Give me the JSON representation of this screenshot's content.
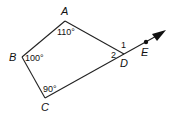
{
  "diagram": {
    "type": "quadrilateral-with-extended-ray",
    "vertices": {
      "A": {
        "label": "A",
        "angle": "110°"
      },
      "B": {
        "label": "B",
        "angle": "100°"
      },
      "C": {
        "label": "C",
        "angle": "90°"
      },
      "D": {
        "label": "D",
        "interior_angle_label": "2",
        "exterior_angle_label": "1"
      }
    },
    "ray": {
      "start": "D",
      "through": "E",
      "point_label": "E"
    },
    "colors": {
      "stroke": "#222222",
      "text": "#111111",
      "background": "#ffffff"
    }
  }
}
